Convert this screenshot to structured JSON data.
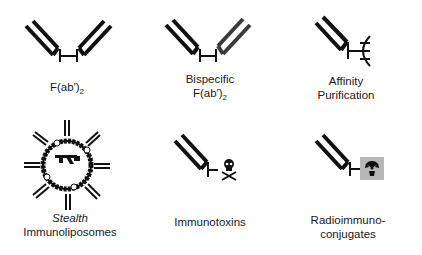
{
  "figure": {
    "items": [
      {
        "id": "fab2",
        "label_lines": [
          "F(ab′)",
          "2"
        ],
        "label_line1": "F(ab′)",
        "label_sub": "2",
        "icon": "fab2-fragment-icon"
      },
      {
        "id": "bispecific",
        "label_line1": "Bispecific",
        "label_line2": "F(ab′)",
        "label_sub": "2",
        "icon": "bispecific-fab2-icon"
      },
      {
        "id": "affinity",
        "label_line1": "Affinity",
        "label_line2": "Purification",
        "icon": "affinity-purification-icon"
      },
      {
        "id": "stealth",
        "label_line1": "Stealth",
        "label_line2": "Immunoliposomes",
        "icon": "stealth-immunoliposome-icon"
      },
      {
        "id": "immunotoxins",
        "label_line1": "Immunotoxins",
        "icon": "immunotoxin-skull-icon"
      },
      {
        "id": "radio",
        "label_line1": "Radioimmuno-",
        "label_line2": "conjugates",
        "icon": "radioimmunoconjugate-icon"
      }
    ],
    "colors": {
      "ink": "#111111",
      "bispecific_arm": "#3a3a3a",
      "radio_box": "#b8b8b8"
    }
  }
}
